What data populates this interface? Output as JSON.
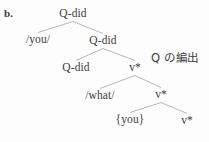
{
  "figure": {
    "label": "b.",
    "annotation": "Q の編出"
  },
  "tree": {
    "nodes": [
      {
        "id": "root",
        "label": "Q-did",
        "x": 73,
        "y": 8
      },
      {
        "id": "you-ph",
        "label": "/you/",
        "x": 38,
        "y": 34
      },
      {
        "id": "qdid2",
        "label": "Q-did",
        "x": 103,
        "y": 35
      },
      {
        "id": "qdid3",
        "label": "Q-did",
        "x": 76,
        "y": 62
      },
      {
        "id": "vstar1",
        "label": "v*",
        "x": 135,
        "y": 62
      },
      {
        "id": "what-ph",
        "label": "/what/",
        "x": 100,
        "y": 90
      },
      {
        "id": "vstar2",
        "label": "v*",
        "x": 161,
        "y": 89
      },
      {
        "id": "you-set",
        "label": "{you}",
        "x": 130,
        "y": 114
      },
      {
        "id": "vstar3",
        "label": "v*",
        "x": 187,
        "y": 115
      }
    ],
    "branches": [
      {
        "from": "root",
        "to": "you-ph"
      },
      {
        "from": "root",
        "to": "qdid2"
      },
      {
        "from": "qdid2",
        "to": "qdid3"
      },
      {
        "from": "qdid2",
        "to": "vstar1"
      },
      {
        "from": "vstar1",
        "to": "what-ph"
      },
      {
        "from": "vstar1",
        "to": "vstar2"
      },
      {
        "from": "vstar2",
        "to": "you-set"
      },
      {
        "from": "vstar2",
        "to": "vstar3"
      }
    ],
    "style": {
      "line_color": "#b8b8b8",
      "text_color": "#404040",
      "background": "#fdfdfd"
    }
  }
}
